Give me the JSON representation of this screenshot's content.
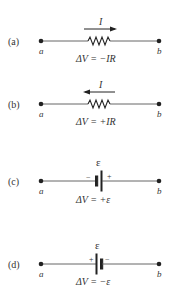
{
  "diagrams": [
    {
      "id": "a",
      "part_label": "(a)",
      "element": "resistor",
      "current_label": "I",
      "current_direction": "right",
      "node_left": "a",
      "node_right": "b",
      "delta_v": "ΔV =  −IR"
    },
    {
      "id": "b",
      "part_label": "(b)",
      "element": "resistor",
      "current_label": "I",
      "current_direction": "left",
      "node_left": "a",
      "node_right": "b",
      "delta_v": "ΔV =  +IR"
    },
    {
      "id": "c",
      "part_label": "(c)",
      "element": "battery",
      "emf_label": "ε",
      "left_terminal": "−",
      "right_terminal": "+",
      "node_left": "a",
      "node_right": "b",
      "delta_v": "ΔV =  +ε"
    },
    {
      "id": "d",
      "part_label": "(d)",
      "element": "battery",
      "emf_label": "ε",
      "left_terminal": "+",
      "right_terminal": "−",
      "node_left": "a",
      "node_right": "b",
      "delta_v": "ΔV =  −ε"
    }
  ]
}
